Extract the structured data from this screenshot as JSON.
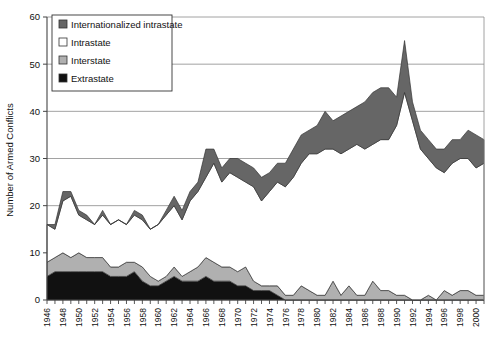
{
  "chart_data": {
    "type": "area",
    "stacked": true,
    "title": "",
    "subtitle": "",
    "xlabel": "",
    "ylabel": "Number of Armed Conflicts",
    "xlim": [
      1946,
      2001
    ],
    "ylim": [
      0,
      60
    ],
    "yticks": [
      0,
      10,
      20,
      30,
      40,
      50,
      60
    ],
    "ytick_labels": [
      "0",
      "10",
      "20",
      "30",
      "40",
      "50",
      "60"
    ],
    "grid": "horizontal-major",
    "legend_position": "top-left-inside",
    "x": [
      1946,
      1947,
      1948,
      1949,
      1950,
      1951,
      1952,
      1953,
      1954,
      1955,
      1956,
      1957,
      1958,
      1959,
      1960,
      1961,
      1962,
      1963,
      1964,
      1965,
      1966,
      1967,
      1968,
      1969,
      1970,
      1971,
      1972,
      1973,
      1974,
      1975,
      1976,
      1977,
      1978,
      1979,
      1980,
      1981,
      1982,
      1983,
      1984,
      1985,
      1986,
      1987,
      1988,
      1989,
      1990,
      1991,
      1992,
      1993,
      1994,
      1995,
      1996,
      1997,
      1998,
      1999,
      2000,
      2001
    ],
    "xtick_labels": [
      "1946",
      "1948",
      "1950",
      "1952",
      "1954",
      "1956",
      "1958",
      "1960",
      "1962",
      "1964",
      "1966",
      "1968",
      "1970",
      "1972",
      "1974",
      "1976",
      "1978",
      "1980",
      "1982",
      "1984",
      "1986",
      "1988",
      "1990",
      "1992",
      "1994",
      "1996",
      "1998",
      "2000"
    ],
    "xtick_label_step": 2,
    "xtick_minor_step": 1,
    "series": [
      {
        "name": "Extrastate",
        "color": "#111111",
        "values": [
          5,
          6,
          6,
          6,
          6,
          6,
          6,
          6,
          5,
          5,
          5,
          6,
          4,
          3,
          3,
          4,
          5,
          4,
          4,
          4,
          5,
          4,
          4,
          4,
          3,
          3,
          2,
          2,
          2,
          1,
          0,
          0,
          0,
          0,
          0,
          0,
          0,
          0,
          0,
          0,
          0,
          0,
          0,
          0,
          0,
          0,
          0,
          0,
          0,
          0,
          0,
          0,
          0,
          0,
          0,
          0
        ]
      },
      {
        "name": "Interstate",
        "color": "#b0b0b0",
        "values": [
          3,
          3,
          4,
          3,
          4,
          3,
          3,
          3,
          2,
          2,
          3,
          2,
          3,
          2,
          1,
          1,
          2,
          1,
          2,
          3,
          4,
          4,
          3,
          3,
          3,
          4,
          2,
          1,
          1,
          2,
          1,
          1,
          3,
          2,
          1,
          1,
          4,
          1,
          3,
          1,
          1,
          4,
          2,
          2,
          1,
          1,
          0,
          0,
          1,
          0,
          2,
          1,
          2,
          2,
          1,
          1
        ]
      },
      {
        "name": "Intrastate",
        "color": "#ffffff",
        "values": [
          8,
          6,
          11,
          13,
          8,
          8,
          7,
          9,
          9,
          10,
          8,
          10,
          10,
          10,
          12,
          13,
          13,
          12,
          15,
          16,
          17,
          21,
          18,
          20,
          20,
          18,
          20,
          18,
          20,
          22,
          23,
          25,
          26,
          29,
          30,
          31,
          28,
          30,
          29,
          32,
          31,
          29,
          32,
          32,
          36,
          43,
          38,
          32,
          29,
          28,
          25,
          28,
          28,
          28,
          27,
          28
        ]
      },
      {
        "name": "Internationalized intrastate",
        "color": "#666666",
        "values": [
          0,
          1,
          2,
          1,
          1,
          1,
          0,
          1,
          0,
          0,
          0,
          1,
          1,
          0,
          0,
          1,
          2,
          2,
          2,
          2,
          6,
          3,
          3,
          3,
          4,
          4,
          4,
          5,
          4,
          4,
          5,
          6,
          6,
          5,
          6,
          8,
          6,
          8,
          8,
          8,
          10,
          11,
          11,
          11,
          6,
          11,
          4,
          4,
          4,
          4,
          5,
          5,
          4,
          6,
          7,
          5
        ]
      }
    ],
    "legend_entries": [
      {
        "label": "Internationalized intrastate",
        "swatch": "#666666",
        "swatch_style": "dark-gray"
      },
      {
        "label": "Intrastate",
        "swatch": "#ffffff",
        "swatch_style": "white"
      },
      {
        "label": "Interstate",
        "swatch": "#b0b0b0",
        "swatch_style": "light-gray"
      },
      {
        "label": "Extrastate",
        "swatch": "#111111",
        "swatch_style": "black"
      }
    ]
  },
  "colors": {
    "axis": "#444444",
    "grid": "#8a8a8a",
    "outline": "#333333",
    "background": "#ffffff"
  }
}
